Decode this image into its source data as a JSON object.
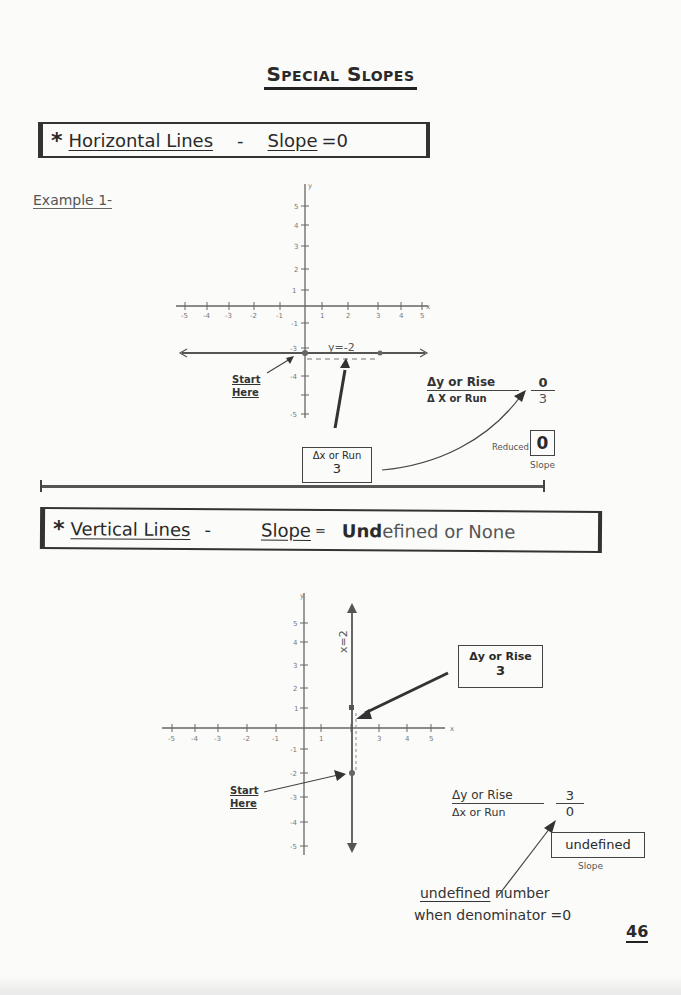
{
  "page": {
    "title": "Special Slopes",
    "page_number": "46"
  },
  "section1": {
    "star": "*",
    "heading": "Horizontal Lines",
    "dash": "-",
    "slope_label": "Slope",
    "slope_value": "=0",
    "example_label": "Example 1-",
    "graph": {
      "x_axis_label": "x",
      "y_axis_label": "y",
      "x_ticks": [
        "-5",
        "-4",
        "-3",
        "-2",
        "-1",
        "1",
        "2",
        "3",
        "4",
        "5"
      ],
      "y_ticks": [
        "5",
        "4",
        "3",
        "2",
        "1",
        "-1",
        "-2",
        "-3",
        "-4",
        "-5"
      ],
      "line_label": "y=-2",
      "points": [
        [
          0,
          -2
        ],
        [
          3,
          -2
        ]
      ]
    },
    "start_here": [
      "Start",
      "Here"
    ],
    "run_box": {
      "line1": "Δx or Run",
      "line2": "3"
    },
    "fraction": {
      "numerator_label": "Δy or Rise",
      "denominator_label": "Δ X or Run",
      "numerator_value": "0",
      "denominator_value": "3"
    },
    "reduced": {
      "label": "Reduced",
      "value": "0",
      "caption": "Slope"
    }
  },
  "section2": {
    "star": "*",
    "heading": "Vertical Lines",
    "dash": "-",
    "slope_label": "Slope",
    "slope_eq": "=",
    "slope_value_bold": "Und",
    "slope_value_rest": "efined or None",
    "graph": {
      "x_axis_label": "x",
      "y_axis_label": "y",
      "x_ticks": [
        "-5",
        "-4",
        "-3",
        "-2",
        "-1",
        "1",
        "2",
        "3",
        "4",
        "5"
      ],
      "y_ticks": [
        "5",
        "4",
        "3",
        "2",
        "1",
        "-1",
        "-2",
        "-3",
        "-4",
        "-5"
      ],
      "line_label": "x=2",
      "points": [
        [
          2,
          1
        ],
        [
          2,
          -2
        ]
      ]
    },
    "rise_box": {
      "line1": "Δy or Rise",
      "line2": "3"
    },
    "start_here": [
      "Start",
      "Here"
    ],
    "fraction": {
      "numerator_label": "Δy or Rise",
      "denominator_label": "Δx or Run",
      "numerator_value": "3",
      "denominator_value": "0"
    },
    "undefined_box": {
      "value": "undefined",
      "caption": "Slope"
    },
    "note": {
      "word": "undefined",
      "rest1": "number",
      "line2": "when denominator =0"
    }
  }
}
